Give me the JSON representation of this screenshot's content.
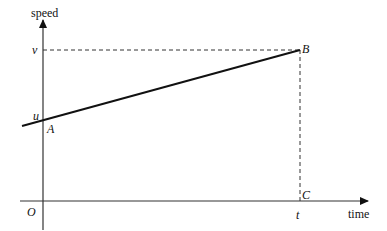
{
  "diagram": {
    "type": "speed-time graph",
    "axes": {
      "y_label": "speed",
      "x_label": "time",
      "origin_label": "O"
    },
    "points": {
      "A": {
        "label": "A"
      },
      "B": {
        "label": "B"
      },
      "C": {
        "label": "C"
      }
    },
    "ticks": {
      "u": "u",
      "v": "v",
      "t": "t"
    },
    "colors": {
      "line": "#111111",
      "axis": "#333333",
      "dashed": "#333333"
    }
  }
}
